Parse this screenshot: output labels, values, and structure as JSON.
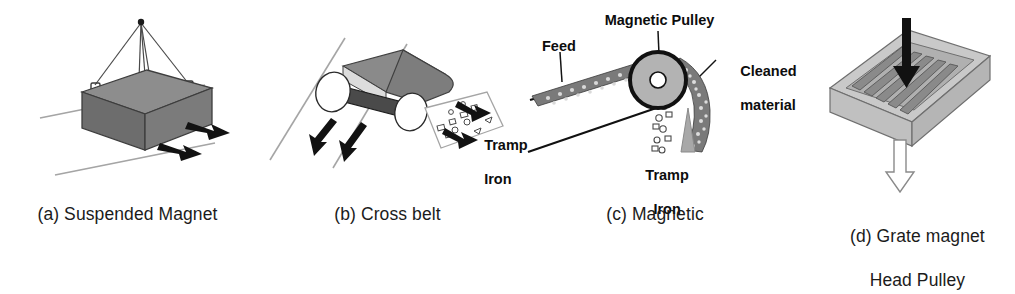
{
  "figure": {
    "background_color": "#ffffff",
    "panel_count": 4
  },
  "panels": [
    {
      "id": "a",
      "caption": "(a) Suspended Magnet",
      "device": "suspended-magnet",
      "labels": [],
      "colors": {
        "magnet_top": "#8d8d8d",
        "magnet_front": "#707070",
        "magnet_side": "#6a6a6a",
        "arrow": "#121212",
        "line": "#9a9a9a"
      },
      "arrow_count": 2,
      "cable_count": 4
    },
    {
      "id": "b",
      "caption": "(b) Cross belt",
      "device": "cross-belt-magnet",
      "labels": [
        {
          "name": "tramp-iron",
          "line1": "Tramp",
          "line2": "Iron"
        }
      ],
      "colors": {
        "belt_top": "#8a8a8a",
        "belt_side": "#7a7a7a",
        "magnet_bar": "#4a4a4a",
        "roller": "#ffffff",
        "arrow": "#121212",
        "line": "#9a9a9a"
      },
      "arrow_count": 4
    },
    {
      "id": "c",
      "caption": "(c) Magnetic",
      "device": "magnetic-head-pulley",
      "labels": [
        {
          "name": "magnetic-pulley",
          "line1": "Magnetic Pulley",
          "line2": ""
        },
        {
          "name": "feed",
          "line1": "Feed",
          "line2": ""
        },
        {
          "name": "cleaned-material",
          "line1": "Cleaned",
          "line2": "material"
        },
        {
          "name": "tramp-iron",
          "line1": "Tramp",
          "line2": "Iron"
        }
      ],
      "colors": {
        "pulley_face": "#b3b3b3",
        "pulley_rim": "#111111",
        "hub": "#ffffff",
        "splitter": "#a8a8a8",
        "material": "#6f6f6f",
        "line": "#111111"
      }
    },
    {
      "id": "d",
      "caption_line1": "(d) Grate magnet",
      "caption_line2": "Head Pulley",
      "device": "grate-magnet",
      "labels": [],
      "colors": {
        "tray_top": "#c9c9c9",
        "tray_side": "#b5b5b5",
        "tray_front": "#c0c0c0",
        "bar": "#8a8a8a",
        "inflow_arrow": "#111111",
        "outflow_arrow": "#ffffff",
        "outflow_stroke": "#8a8a8a"
      },
      "bar_count": 5
    }
  ]
}
